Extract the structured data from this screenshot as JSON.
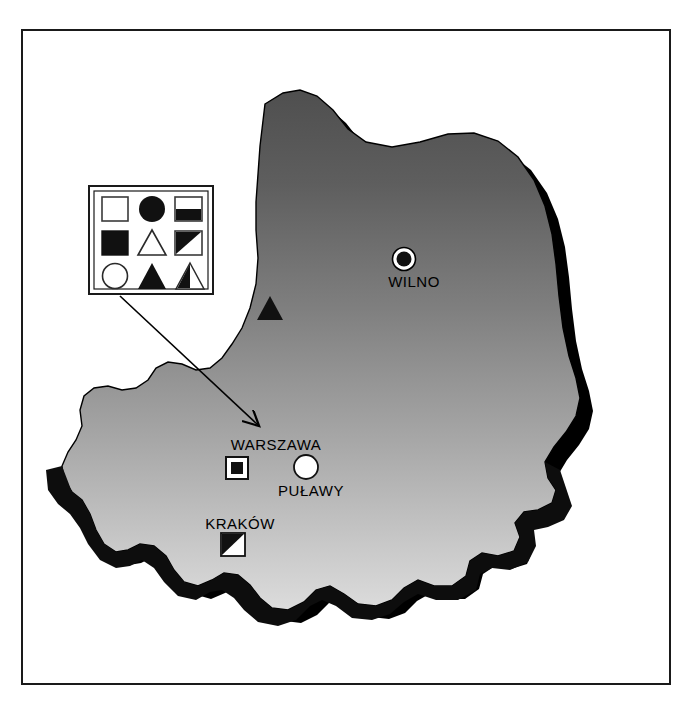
{
  "figure": {
    "background_color": "#ffffff",
    "frame_color": "#1a1a1a",
    "landmass_gradient_top": "#5a5a5a",
    "landmass_gradient_bottom": "#d6d6d6",
    "shadow_color": "#000000",
    "outline_color": "#000000"
  },
  "legend": {
    "name": "symbol-legend",
    "border_color": "#1a1a1a",
    "background_color": "#ffffff",
    "rows": [
      [
        {
          "symbol": "open-square",
          "shape": "square",
          "fill": "none"
        },
        {
          "symbol": "filled-circle",
          "shape": "circle",
          "fill": "solid"
        },
        {
          "symbol": "square-bottom-half-filled",
          "shape": "square",
          "fill": "bottom-half"
        }
      ],
      [
        {
          "symbol": "filled-square",
          "shape": "square",
          "fill": "solid"
        },
        {
          "symbol": "open-triangle",
          "shape": "triangle",
          "fill": "none"
        },
        {
          "symbol": "square-diagonal-upper-left-filled",
          "shape": "square",
          "fill": "diagonal-upper-left"
        }
      ],
      [
        {
          "symbol": "open-circle",
          "shape": "circle",
          "fill": "none"
        },
        {
          "symbol": "filled-triangle",
          "shape": "triangle",
          "fill": "solid"
        },
        {
          "symbol": "triangle-left-half-filled",
          "shape": "triangle",
          "fill": "left-half"
        }
      ]
    ]
  },
  "cities": [
    {
      "name": "WILNO",
      "symbol": "filled-circle-with-white-ring",
      "label_x": 414,
      "label_y": 286,
      "marker_x": 404,
      "marker_y": 258
    },
    {
      "name": "WARSZAWA",
      "symbol": "filled-square-in-open-square",
      "label_x": 276,
      "label_y": 450,
      "marker_x": 237,
      "marker_y": 468
    },
    {
      "name": "PUŁAWY",
      "symbol": "open-circle",
      "label_x": 311,
      "label_y": 495,
      "marker_x": 305,
      "marker_y": 467
    },
    {
      "name": "KRAKÓW",
      "symbol": "square-diagonal-upper-left-filled",
      "label_x": 240,
      "label_y": 528,
      "marker_x": 232,
      "marker_y": 544
    }
  ],
  "standalone_markers": [
    {
      "symbol": "filled-triangle",
      "x": 270,
      "y": 311
    }
  ],
  "annotation": {
    "name": "legend-pointer-arrow",
    "from_x": 120,
    "from_y": 295,
    "to_x": 259,
    "to_y": 430,
    "color": "#000000"
  }
}
